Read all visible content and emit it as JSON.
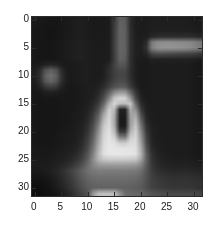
{
  "figure": {
    "type": "grayscale-image-plot",
    "background_color": "#ffffff",
    "axis_color": "#2b2b2b",
    "label_color": "#1a1a1a"
  },
  "axes": {
    "x_ticks": [
      "0",
      "5",
      "10",
      "15",
      "20",
      "25",
      "30"
    ],
    "y_ticks": [
      "0",
      "5",
      "10",
      "15",
      "20",
      "25",
      "30"
    ],
    "x_tick_values": [
      0,
      5,
      10,
      15,
      20,
      25,
      30
    ],
    "y_tick_values": [
      0,
      5,
      10,
      15,
      20,
      25,
      30
    ],
    "xlabel": "",
    "ylabel": "",
    "title": ""
  },
  "chart_data": {
    "type": "heatmap",
    "title": "",
    "xlabel": "",
    "ylabel": "",
    "colormap": "gray",
    "vmin": 0,
    "vmax": 255,
    "grid": false,
    "legend": "none",
    "xlim": [
      -0.5,
      31.5
    ],
    "ylim": [
      31.5,
      -0.5
    ],
    "y_axis_direction": "reversed",
    "width": 32,
    "height": 32,
    "x": [
      0,
      1,
      2,
      3,
      4,
      5,
      6,
      7,
      8,
      9,
      10,
      11,
      12,
      13,
      14,
      15,
      16,
      17,
      18,
      19,
      20,
      21,
      22,
      23,
      24,
      25,
      26,
      27,
      28,
      29,
      30,
      31
    ],
    "y": [
      0,
      1,
      2,
      3,
      4,
      5,
      6,
      7,
      8,
      9,
      10,
      11,
      12,
      13,
      14,
      15,
      16,
      17,
      18,
      19,
      20,
      21,
      22,
      23,
      24,
      25,
      26,
      27,
      28,
      29,
      30,
      31
    ],
    "values": [
      [
        28,
        26,
        24,
        22,
        22,
        24,
        26,
        28,
        30,
        30,
        28,
        26,
        26,
        26,
        28,
        60,
        96,
        92,
        44,
        30,
        28,
        28,
        30,
        30,
        30,
        30,
        30,
        30,
        30,
        30,
        28,
        26
      ],
      [
        26,
        24,
        22,
        22,
        22,
        24,
        26,
        28,
        30,
        30,
        28,
        26,
        26,
        26,
        28,
        60,
        98,
        94,
        44,
        30,
        28,
        28,
        30,
        30,
        30,
        30,
        30,
        30,
        30,
        30,
        28,
        26
      ],
      [
        24,
        22,
        22,
        20,
        22,
        24,
        26,
        28,
        30,
        30,
        28,
        26,
        26,
        26,
        28,
        62,
        100,
        96,
        46,
        30,
        28,
        28,
        32,
        32,
        32,
        32,
        32,
        32,
        32,
        32,
        30,
        28
      ],
      [
        24,
        22,
        22,
        20,
        22,
        24,
        26,
        28,
        30,
        30,
        28,
        26,
        26,
        26,
        28,
        62,
        100,
        96,
        46,
        30,
        28,
        30,
        40,
        44,
        46,
        46,
        46,
        46,
        46,
        46,
        44,
        40
      ],
      [
        24,
        22,
        22,
        22,
        24,
        26,
        28,
        30,
        32,
        32,
        30,
        28,
        28,
        28,
        30,
        64,
        102,
        98,
        48,
        32,
        30,
        44,
        120,
        138,
        142,
        142,
        142,
        140,
        138,
        136,
        130,
        120
      ],
      [
        24,
        22,
        22,
        22,
        24,
        26,
        28,
        30,
        32,
        32,
        30,
        28,
        28,
        28,
        30,
        64,
        102,
        98,
        48,
        32,
        32,
        50,
        126,
        144,
        148,
        148,
        148,
        146,
        144,
        140,
        134,
        124
      ],
      [
        24,
        22,
        22,
        22,
        24,
        26,
        28,
        30,
        32,
        32,
        30,
        28,
        28,
        28,
        30,
        64,
        100,
        96,
        48,
        32,
        30,
        38,
        72,
        80,
        80,
        78,
        76,
        74,
        72,
        70,
        66,
        60
      ],
      [
        24,
        22,
        22,
        22,
        24,
        26,
        28,
        30,
        32,
        32,
        30,
        28,
        28,
        28,
        30,
        62,
        98,
        94,
        46,
        30,
        28,
        28,
        34,
        34,
        34,
        34,
        34,
        34,
        34,
        34,
        32,
        30
      ],
      [
        26,
        28,
        34,
        38,
        34,
        28,
        26,
        26,
        28,
        30,
        30,
        28,
        28,
        30,
        40,
        66,
        88,
        84,
        48,
        30,
        26,
        26,
        28,
        28,
        28,
        28,
        28,
        28,
        28,
        28,
        26,
        24
      ],
      [
        30,
        44,
        82,
        96,
        82,
        44,
        28,
        26,
        28,
        30,
        30,
        28,
        28,
        32,
        46,
        64,
        74,
        72,
        46,
        30,
        26,
        26,
        28,
        28,
        28,
        28,
        28,
        28,
        28,
        28,
        26,
        24
      ],
      [
        32,
        50,
        96,
        112,
        96,
        50,
        30,
        26,
        28,
        30,
        30,
        28,
        28,
        32,
        46,
        62,
        70,
        68,
        46,
        30,
        26,
        26,
        28,
        28,
        28,
        28,
        28,
        28,
        28,
        28,
        26,
        24
      ],
      [
        30,
        46,
        86,
        100,
        86,
        46,
        28,
        26,
        28,
        30,
        30,
        28,
        30,
        36,
        52,
        68,
        76,
        74,
        50,
        32,
        26,
        26,
        28,
        28,
        28,
        28,
        28,
        28,
        28,
        28,
        26,
        24
      ],
      [
        26,
        34,
        54,
        62,
        54,
        34,
        26,
        24,
        26,
        28,
        30,
        30,
        34,
        46,
        64,
        82,
        92,
        90,
        62,
        38,
        26,
        26,
        28,
        28,
        28,
        28,
        28,
        28,
        28,
        28,
        26,
        24
      ],
      [
        24,
        24,
        30,
        32,
        30,
        26,
        24,
        24,
        26,
        28,
        30,
        32,
        40,
        62,
        96,
        140,
        158,
        156,
        104,
        54,
        30,
        26,
        28,
        28,
        28,
        28,
        28,
        28,
        28,
        28,
        26,
        24
      ],
      [
        24,
        22,
        24,
        24,
        24,
        24,
        24,
        24,
        26,
        28,
        30,
        34,
        48,
        78,
        132,
        196,
        214,
        212,
        150,
        72,
        34,
        28,
        28,
        28,
        28,
        28,
        28,
        28,
        28,
        28,
        26,
        24
      ],
      [
        24,
        22,
        22,
        22,
        22,
        24,
        24,
        24,
        26,
        28,
        32,
        40,
        60,
        104,
        176,
        214,
        190,
        188,
        200,
        104,
        44,
        30,
        28,
        28,
        28,
        28,
        28,
        28,
        28,
        28,
        26,
        24
      ],
      [
        24,
        22,
        22,
        22,
        22,
        24,
        24,
        24,
        26,
        30,
        34,
        48,
        76,
        136,
        206,
        184,
        36,
        34,
        172,
        138,
        58,
        32,
        28,
        28,
        28,
        28,
        28,
        28,
        28,
        28,
        26,
        24
      ],
      [
        24,
        22,
        22,
        22,
        22,
        24,
        24,
        26,
        28,
        30,
        38,
        58,
        96,
        168,
        214,
        170,
        30,
        28,
        160,
        168,
        78,
        36,
        30,
        28,
        28,
        28,
        28,
        28,
        28,
        28,
        26,
        24
      ],
      [
        24,
        22,
        22,
        22,
        22,
        24,
        24,
        26,
        28,
        32,
        42,
        66,
        112,
        186,
        218,
        166,
        28,
        26,
        156,
        186,
        96,
        42,
        30,
        28,
        28,
        28,
        28,
        28,
        28,
        28,
        26,
        24
      ],
      [
        24,
        22,
        22,
        22,
        22,
        24,
        26,
        26,
        30,
        34,
        48,
        76,
        130,
        200,
        222,
        170,
        30,
        28,
        160,
        200,
        116,
        50,
        32,
        30,
        28,
        28,
        28,
        28,
        28,
        28,
        26,
        24
      ],
      [
        24,
        22,
        22,
        22,
        24,
        26,
        26,
        28,
        30,
        36,
        54,
        86,
        144,
        208,
        226,
        186,
        60,
        58,
        180,
        210,
        132,
        58,
        34,
        30,
        28,
        28,
        28,
        28,
        28,
        28,
        26,
        24
      ],
      [
        24,
        22,
        22,
        22,
        24,
        26,
        28,
        28,
        32,
        40,
        60,
        96,
        156,
        214,
        228,
        210,
        130,
        126,
        204,
        216,
        146,
        66,
        36,
        30,
        28,
        28,
        28,
        28,
        28,
        28,
        26,
        24
      ],
      [
        24,
        24,
        22,
        24,
        24,
        26,
        28,
        30,
        34,
        44,
        66,
        106,
        166,
        218,
        230,
        224,
        206,
        204,
        220,
        220,
        158,
        74,
        38,
        32,
        30,
        28,
        28,
        28,
        28,
        28,
        26,
        24
      ],
      [
        26,
        24,
        24,
        24,
        26,
        28,
        30,
        32,
        38,
        50,
        74,
        118,
        176,
        222,
        232,
        230,
        228,
        228,
        228,
        224,
        170,
        84,
        42,
        34,
        30,
        28,
        28,
        28,
        28,
        28,
        26,
        24
      ],
      [
        26,
        26,
        24,
        26,
        28,
        30,
        32,
        36,
        44,
        58,
        84,
        130,
        186,
        224,
        232,
        232,
        232,
        232,
        230,
        226,
        178,
        94,
        48,
        36,
        32,
        30,
        28,
        28,
        28,
        28,
        26,
        24
      ],
      [
        28,
        26,
        26,
        28,
        30,
        32,
        36,
        42,
        52,
        68,
        96,
        140,
        178,
        196,
        200,
        200,
        200,
        200,
        198,
        194,
        160,
        96,
        52,
        40,
        34,
        32,
        30,
        30,
        30,
        30,
        28,
        26
      ],
      [
        28,
        28,
        28,
        30,
        34,
        38,
        44,
        54,
        66,
        84,
        108,
        132,
        148,
        152,
        152,
        152,
        152,
        152,
        150,
        148,
        130,
        90,
        56,
        44,
        38,
        36,
        34,
        34,
        34,
        34,
        32,
        30
      ],
      [
        26,
        26,
        28,
        32,
        38,
        46,
        56,
        68,
        82,
        98,
        112,
        120,
        124,
        124,
        124,
        124,
        124,
        124,
        122,
        120,
        110,
        84,
        60,
        50,
        44,
        42,
        40,
        40,
        40,
        40,
        38,
        36
      ],
      [
        22,
        22,
        24,
        28,
        34,
        42,
        52,
        64,
        78,
        92,
        104,
        110,
        112,
        112,
        112,
        112,
        112,
        112,
        110,
        108,
        100,
        82,
        64,
        56,
        52,
        50,
        48,
        48,
        48,
        48,
        46,
        44
      ],
      [
        18,
        18,
        20,
        24,
        30,
        38,
        48,
        58,
        72,
        86,
        96,
        102,
        104,
        104,
        104,
        104,
        104,
        104,
        102,
        100,
        94,
        80,
        66,
        60,
        56,
        54,
        52,
        52,
        52,
        52,
        50,
        48
      ],
      [
        16,
        16,
        18,
        22,
        28,
        34,
        44,
        54,
        66,
        80,
        90,
        96,
        98,
        98,
        98,
        98,
        98,
        98,
        96,
        94,
        90,
        78,
        66,
        62,
        58,
        56,
        54,
        54,
        54,
        54,
        52,
        50
      ],
      [
        14,
        14,
        16,
        18,
        22,
        28,
        36,
        46,
        58,
        70,
        82,
        150,
        186,
        190,
        190,
        188,
        146,
        110,
        104,
        102,
        100,
        92,
        84,
        80,
        76,
        74,
        72,
        72,
        72,
        72,
        70,
        68
      ]
    ]
  }
}
